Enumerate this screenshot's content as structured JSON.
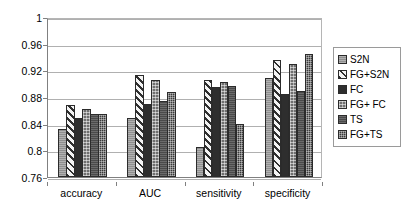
{
  "chart_data": {
    "type": "bar",
    "title": "",
    "subtitle": "",
    "xlabel": "",
    "ylabel": "",
    "categories": [
      "accuracy",
      "AUC",
      "sensitivity",
      "specificity"
    ],
    "series": [
      {
        "name": "S2N",
        "pattern": "solid-gray",
        "values": [
          0.832,
          0.849,
          0.805,
          0.909
        ]
      },
      {
        "name": "FG+S2N",
        "pattern": "diagonal-hatch",
        "values": [
          0.868,
          0.913,
          0.905,
          0.936
        ]
      },
      {
        "name": "FC",
        "pattern": "solid-dark",
        "values": [
          0.849,
          0.869,
          0.895,
          0.884
        ]
      },
      {
        "name": "FG+ FC",
        "pattern": "dotted-gray",
        "values": [
          0.862,
          0.906,
          0.902,
          0.93
        ]
      },
      {
        "name": "TS",
        "pattern": "solid-dark-gray",
        "values": [
          0.855,
          0.874,
          0.896,
          0.889
        ]
      },
      {
        "name": "FG+TS",
        "pattern": "cross-hatch-dark",
        "values": [
          0.854,
          0.887,
          0.839,
          0.945
        ]
      }
    ],
    "ylim": [
      0.76,
      1
    ],
    "yticks": [
      0.76,
      0.8,
      0.84,
      0.88,
      0.92,
      0.96,
      1
    ],
    "ytick_labels": [
      "0.76",
      "0.8",
      "0.84",
      "0.88",
      "0.92",
      "0.96",
      "1"
    ],
    "grid": true,
    "legend_position": "right"
  },
  "legend": {
    "items": [
      {
        "label": "S2N"
      },
      {
        "label": "FG+S2N"
      },
      {
        "label": "FC"
      },
      {
        "label": "FG+ FC"
      },
      {
        "label": "TS"
      },
      {
        "label": "FG+TS"
      }
    ]
  }
}
